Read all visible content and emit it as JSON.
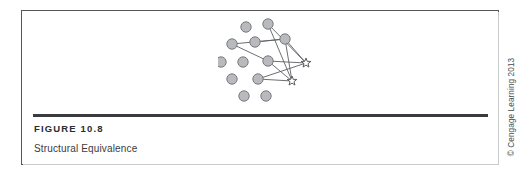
{
  "figure": {
    "number_label": "FIGURE 10.8",
    "caption": "Structural Equivalence",
    "credit": "© Cengage Learning 2013"
  },
  "colors": {
    "node_fill": "#b9babd",
    "node_stroke": "#6e6f73",
    "edge_stroke": "#5e5f63",
    "star_stroke": "#4a4b4f",
    "frame": "#55565a",
    "rule": "#3a3b3f",
    "text": "#2b2c30",
    "background": "#ffffff"
  },
  "diagram": {
    "type": "node-link-network",
    "node_radius": 5.2,
    "star_radius": 5.0,
    "circle_nodes": [
      {
        "id": "c1",
        "x": 28,
        "y": 12
      },
      {
        "id": "c2",
        "x": 50,
        "y": 9
      },
      {
        "id": "c3",
        "x": 14,
        "y": 29
      },
      {
        "id": "c4",
        "x": 37,
        "y": 27
      },
      {
        "id": "c5",
        "x": 67,
        "y": 24
      },
      {
        "id": "c6",
        "x": 3,
        "y": 47
      },
      {
        "id": "c7",
        "x": 25,
        "y": 47
      },
      {
        "id": "c8",
        "x": 50,
        "y": 46
      },
      {
        "id": "c9",
        "x": 14,
        "y": 64
      },
      {
        "id": "c10",
        "x": 40,
        "y": 64
      },
      {
        "id": "c11",
        "x": 26,
        "y": 81
      },
      {
        "id": "c12",
        "x": 48,
        "y": 81
      }
    ],
    "star_nodes": [
      {
        "id": "s1",
        "x": 88,
        "y": 48
      },
      {
        "id": "s2",
        "x": 74,
        "y": 66
      }
    ],
    "edges": [
      {
        "from": "c2",
        "to": "s1"
      },
      {
        "from": "c2",
        "to": "s2"
      },
      {
        "from": "c5",
        "to": "s1"
      },
      {
        "from": "c5",
        "to": "s2"
      },
      {
        "from": "c8",
        "to": "s1"
      },
      {
        "from": "c8",
        "to": "s2"
      },
      {
        "from": "c10",
        "to": "s1"
      },
      {
        "from": "c10",
        "to": "s2"
      },
      {
        "from": "c3",
        "to": "c5"
      },
      {
        "from": "c3",
        "to": "c8"
      },
      {
        "from": "c4",
        "to": "c5"
      }
    ]
  }
}
